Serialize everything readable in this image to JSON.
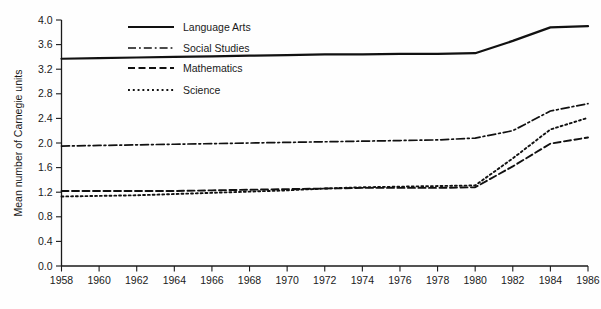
{
  "chart_data": {
    "type": "line",
    "title": "",
    "subtitle": "",
    "xlabel": "",
    "ylabel": "Mean number of Carnegie units",
    "xlim": [
      1958,
      1986
    ],
    "ylim": [
      0.0,
      4.0
    ],
    "grid": false,
    "legend_position": "upper-left-inside",
    "x_ticks": [
      1958,
      1960,
      1962,
      1964,
      1966,
      1968,
      1970,
      1972,
      1974,
      1976,
      1978,
      1980,
      1982,
      1984,
      1986
    ],
    "x_tick_labels": [
      "1958",
      "1960",
      "1962",
      "1964",
      "1966",
      "1968",
      "1970",
      "1972",
      "1974",
      "1976",
      "1978",
      "1980",
      "1982",
      "1984",
      "1986"
    ],
    "y_ticks": [
      0.0,
      0.4,
      0.8,
      1.2,
      1.6,
      2.0,
      2.4,
      2.8,
      3.2,
      3.6,
      4.0
    ],
    "y_tick_labels": [
      "0.0",
      "0.4",
      "0.8",
      "1.2",
      "1.6",
      "2.0",
      "2.4",
      "2.8",
      "3.2",
      "3.6",
      "4.0"
    ],
    "x": [
      1958,
      1960,
      1962,
      1964,
      1966,
      1968,
      1970,
      1972,
      1974,
      1976,
      1978,
      1980,
      1982,
      1984,
      1986
    ],
    "series": [
      {
        "name": "Language Arts",
        "dash": "solid",
        "width": 2.2,
        "values": [
          3.37,
          3.38,
          3.39,
          3.4,
          3.41,
          3.42,
          3.43,
          3.44,
          3.44,
          3.45,
          3.45,
          3.46,
          3.66,
          3.88,
          3.9
        ]
      },
      {
        "name": "Social Studies",
        "dash": "dash-dot",
        "width": 1.7,
        "values": [
          1.95,
          1.96,
          1.97,
          1.98,
          1.99,
          2.0,
          2.01,
          2.02,
          2.03,
          2.04,
          2.05,
          2.08,
          2.2,
          2.52,
          2.64
        ]
      },
      {
        "name": "Mathematics",
        "dash": "dashed",
        "width": 1.9,
        "values": [
          1.22,
          1.22,
          1.22,
          1.22,
          1.23,
          1.24,
          1.25,
          1.26,
          1.27,
          1.27,
          1.27,
          1.28,
          1.62,
          1.99,
          2.09
        ]
      },
      {
        "name": "Science",
        "dash": "dotted",
        "width": 1.9,
        "values": [
          1.13,
          1.14,
          1.15,
          1.17,
          1.19,
          1.21,
          1.23,
          1.26,
          1.28,
          1.29,
          1.3,
          1.31,
          1.75,
          2.22,
          2.41
        ]
      }
    ]
  },
  "legend": {
    "items": [
      {
        "label": "Language Arts"
      },
      {
        "label": "Social Studies"
      },
      {
        "label": "Mathematics"
      },
      {
        "label": "Science"
      }
    ]
  },
  "colors": {
    "ink": "#111111",
    "background": "#fefefe"
  }
}
